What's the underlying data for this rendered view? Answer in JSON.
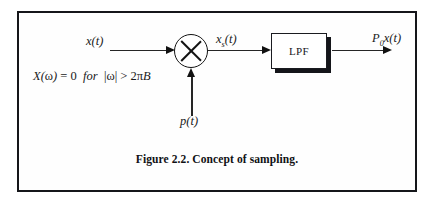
{
  "figure": {
    "caption": "Figure 2.2. Concept of sampling.",
    "border_color": "#15161a",
    "background": "#ffffff"
  },
  "diagram": {
    "type": "block-diagram",
    "title": "Concept of sampling",
    "input_label": "x(t)",
    "intermediate_label_base": "x",
    "intermediate_label_sub": "s",
    "intermediate_label_tail": "(t)",
    "carrier_label": "p(t)",
    "output_label_base": "P",
    "output_label_sub": "0",
    "output_label_tail": "x(t)",
    "mixer": {
      "name": "multiplier",
      "glyph": "cross-in-circle"
    },
    "filter": {
      "label": "LPF",
      "shadow_color": "#14151a"
    },
    "condition": {
      "expr_x": "X(",
      "expr_omega": "ω",
      "expr_close": ")",
      "expr_eq": "=",
      "expr_zero": "0",
      "expr_for": "for",
      "expr_abs_open": "|",
      "expr_abs_omega": "ω",
      "expr_abs_close": "|",
      "expr_gt": ">",
      "expr_two": "2",
      "expr_pi": "π",
      "expr_b": "B",
      "full_text": "X(ω) = 0 for |ω| > 2πB"
    },
    "wires": [
      {
        "name": "input-wire",
        "from": "x(t)",
        "to": "multiplier",
        "direction": "right"
      },
      {
        "name": "carrier-wire",
        "from": "p(t)",
        "to": "multiplier",
        "direction": "up"
      },
      {
        "name": "mixer-to-lpf-wire",
        "from": "multiplier",
        "to": "LPF",
        "direction": "right"
      },
      {
        "name": "output-wire",
        "from": "LPF",
        "to": "P0x(t)",
        "direction": "right"
      }
    ]
  }
}
